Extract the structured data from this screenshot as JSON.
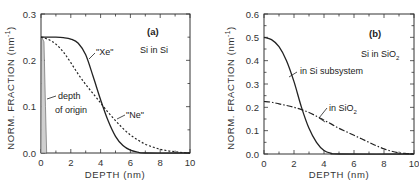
{
  "chart_data": [
    {
      "type": "line",
      "panel": "(a)",
      "title": "Si in Si",
      "xlabel": "DEPTH (nm)",
      "ylabel": "NORM. FRACTION (nm^-1)",
      "xlim": [
        0,
        10
      ],
      "ylim": [
        0,
        0.3
      ],
      "xticks": [
        0,
        2,
        4,
        6,
        8,
        10
      ],
      "yticks": [
        0.0,
        0.1,
        0.2,
        0.3
      ],
      "ytick_labels": [
        "0.0",
        "0.1",
        "0.2",
        "0.3"
      ],
      "grid": false,
      "series": [
        {
          "name": "\"Xe\"",
          "style": "solid",
          "x": [
            0,
            0.5,
            1,
            1.5,
            2,
            2.5,
            3,
            3.5,
            4,
            4.5,
            5,
            5.5,
            6,
            6.5,
            7,
            10
          ],
          "values": [
            0.25,
            0.25,
            0.25,
            0.249,
            0.246,
            0.237,
            0.212,
            0.165,
            0.115,
            0.07,
            0.036,
            0.016,
            0.006,
            0.002,
            0.0,
            0.0
          ]
        },
        {
          "name": "\"Ne\"",
          "style": "dotted",
          "x": [
            0,
            0.5,
            1,
            1.5,
            2,
            2.5,
            3,
            3.5,
            4,
            4.5,
            5,
            5.5,
            6,
            6.5,
            7,
            7.5,
            8,
            8.5,
            9,
            9.5,
            10
          ],
          "values": [
            0.25,
            0.245,
            0.235,
            0.218,
            0.195,
            0.17,
            0.148,
            0.128,
            0.108,
            0.088,
            0.07,
            0.053,
            0.039,
            0.028,
            0.019,
            0.013,
            0.008,
            0.005,
            0.003,
            0.001,
            0.0
          ]
        },
        {
          "name": "depth of origin",
          "style": "filled",
          "x": [
            0,
            0.03,
            0.05,
            0.2,
            0.3,
            0.38,
            0.4
          ],
          "values": [
            0.0,
            0.25,
            0.25,
            0.24,
            0.1,
            0.0,
            0.0
          ]
        }
      ],
      "annotations": [
        "(a)",
        "Si in Si",
        "\"Xe\"",
        "\"Ne\"",
        "depth",
        "of origin"
      ]
    },
    {
      "type": "line",
      "panel": "(b)",
      "title": "Si in SiO2",
      "xlabel": "DEPTH (nm)",
      "ylabel": "NORM. FRACTION (nm^-1)",
      "xlim": [
        0,
        10
      ],
      "ylim": [
        0,
        0.6
      ],
      "xticks": [
        0,
        2,
        4,
        6,
        8,
        10
      ],
      "yticks": [
        0.0,
        0.1,
        0.2,
        0.3,
        0.4,
        0.5,
        0.6
      ],
      "ytick_labels": [
        "0.0",
        "0.1",
        "0.2",
        "0.3",
        "0.4",
        "0.5",
        "0.6"
      ],
      "grid": false,
      "series": [
        {
          "name": "in Si subsystem",
          "style": "solid",
          "x": [
            0,
            0.5,
            1,
            1.5,
            2,
            2.5,
            3,
            3.5,
            4,
            4.5,
            5,
            10
          ],
          "values": [
            0.5,
            0.49,
            0.46,
            0.4,
            0.31,
            0.2,
            0.11,
            0.05,
            0.015,
            0.003,
            0.0,
            0.0
          ]
        },
        {
          "name": "in SiO2",
          "style": "dash-dot",
          "x": [
            0,
            0.5,
            1,
            1.5,
            2,
            2.5,
            3,
            3.5,
            4,
            4.5,
            5,
            5.5,
            6,
            6.5,
            7,
            7.5,
            8,
            8.5,
            9,
            9.5,
            10
          ],
          "values": [
            0.225,
            0.222,
            0.215,
            0.208,
            0.2,
            0.19,
            0.178,
            0.162,
            0.145,
            0.128,
            0.11,
            0.095,
            0.08,
            0.065,
            0.05,
            0.035,
            0.022,
            0.012,
            0.005,
            0.002,
            0.0
          ]
        }
      ],
      "annotations": [
        "(b)",
        "Si in SiO2",
        "in Si subsystem",
        "in SiO2"
      ]
    }
  ],
  "labels": {
    "a_tag": "(a)",
    "a_title": "Si in Si",
    "a_xe": "\"Xe\"",
    "a_ne": "\"Ne\"",
    "a_depth1": "depth",
    "a_depth2": "of origin",
    "b_tag": "(b)",
    "b_title_main": "Si in SiO",
    "b_title_sub": "2",
    "b_si_sub": "in Si subsystem",
    "b_sio2_main": "in SiO",
    "b_sio2_sub": "2",
    "xlabel": "DEPTH  (nm)",
    "ylabel_main": "NORM.  FRACTION  (nm",
    "ylabel_sup": "-1",
    "ylabel_end": ")"
  },
  "colors": {
    "line": "#222222",
    "frame": "#333333",
    "fill": "#cfcfcf"
  }
}
